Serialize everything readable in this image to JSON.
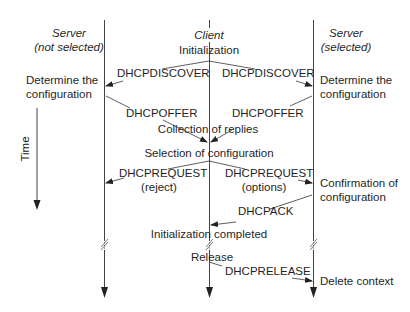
{
  "diagram": {
    "type": "sequence-diagram",
    "topic": "DHCP client-server message exchange",
    "lifelines": [
      {
        "id": "server_not_selected",
        "title_line1": "Server",
        "title_line2": "(not selected)"
      },
      {
        "id": "client",
        "title_line1": "Client"
      },
      {
        "id": "server_selected",
        "title_line1": "Server",
        "title_line2": "(selected)"
      }
    ],
    "time_axis_label": "Time",
    "states": {
      "client_init": "Initialization",
      "left_determine_1": "Determine the",
      "left_determine_2": "configuration",
      "right_determine_1": "Determine the",
      "right_determine_2": "configuration",
      "collection": "Collection of replies",
      "selection": "Selection of configuration",
      "confirm_1": "Confirmation of",
      "confirm_2": "configuration",
      "init_completed": "Initialization completed",
      "release": "Release",
      "delete_context": "Delete context"
    },
    "messages": [
      {
        "label": "DHCPDISCOVER",
        "from": "client",
        "to": "server_not_selected"
      },
      {
        "label": "DHCPDISCOVER",
        "from": "client",
        "to": "server_selected"
      },
      {
        "label": "DHCPOFFER",
        "from": "server_not_selected",
        "to": "client"
      },
      {
        "label": "DHCPOFFER",
        "from": "server_selected",
        "to": "client"
      },
      {
        "label": "DHCPREQUEST",
        "sublabel": "(reject)",
        "from": "client",
        "to": "server_not_selected"
      },
      {
        "label": "DHCPREQUEST",
        "sublabel": "(options)",
        "from": "client",
        "to": "server_selected"
      },
      {
        "label": "DHCPACK",
        "from": "server_selected",
        "to": "client"
      },
      {
        "label": "DHCPRELEASE",
        "from": "client",
        "to": "server_selected"
      }
    ],
    "colors": {
      "line": "#333333",
      "text": "#1f1f1f",
      "background": "#ffffff"
    }
  }
}
